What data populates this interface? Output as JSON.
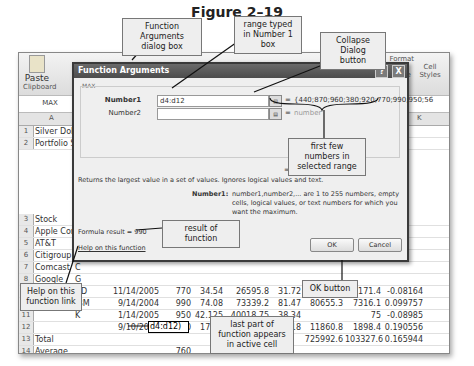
{
  "figure_title": "Figure 2–19",
  "ribbon": {
    "paste_label": "Paste",
    "clipboard_group": "Clipboard",
    "format_table_label": "Format as Table",
    "cell_styles_label": "Cell Styles"
  },
  "name_box": "MAX",
  "columns": [
    "A",
    "K"
  ],
  "rows": [
    {
      "n": "1",
      "a": "Silver Dollar"
    },
    {
      "n": "2",
      "a": "Portfolio Su"
    },
    {
      "n": "3",
      "a": "Stock",
      "b": "S"
    },
    {
      "n": "4",
      "a": "Apple Cor",
      "b": "A"
    },
    {
      "n": "5",
      "a": "AT&T",
      "b": "T"
    },
    {
      "n": "6",
      "a": "Citigroup",
      "b": "C"
    },
    {
      "n": "7",
      "a": "Comcast",
      "b": "C"
    },
    {
      "n": "8",
      "a": "Google",
      "b": "G"
    },
    {
      "n": "9",
      "a": "Home Dep",
      "b": "HD",
      "c": "11/14/2005",
      "d": "770",
      "e": "34.54",
      "f": "26595.8",
      "g": "31.72",
      "h": "24424.4",
      "i": "-2171.4",
      "j": "-0.08164"
    },
    {
      "n": "10",
      "a": "IBM",
      "b": "IBM",
      "c": "9/14/2004",
      "d": "990",
      "e": "74.08",
      "f": "73339.2",
      "g": "81.47",
      "h": "80655.3",
      "i": "7316.1",
      "j": "0.099757"
    },
    {
      "n": "11",
      "a": "",
      "b": "K",
      "c": "1/14/2005",
      "d": "950",
      "e": "42.125",
      "f": "40018.75",
      "g": "38.34",
      "h": "",
      "i": "75",
      "j": "-0.08985"
    },
    {
      "n": "12",
      "a": "",
      "b": "",
      "c": "9/10/2003",
      "d": "560",
      "e": "17.79",
      "f": "9962.4",
      "g": "21.18",
      "h": "11860.8",
      "i": "1898.4",
      "j": "0.190556"
    },
    {
      "n": "13",
      "a": "Total",
      "f": "622665.1",
      "h": "725992.6",
      "i": "103327.6",
      "j": "0.165944"
    },
    {
      "n": "14",
      "a": "Average",
      "d": "760"
    },
    {
      "n": "15",
      "a": "Highest",
      "d": "d4:d12)"
    },
    {
      "n": "16",
      "a": "Lowest"
    }
  ],
  "dialog": {
    "title": "Function Arguments",
    "help_btn": "?",
    "close_btn": "X",
    "function_name": "MAX",
    "number1_label": "Number1",
    "number1_value": "d4:d12",
    "number1_result": "{440;870;960;380;920;770;990;950;56",
    "number2_label": "Number2",
    "number2_result": "number",
    "equals": "=",
    "overall_result": "= 990",
    "description": "Returns the largest value in a set of values. Ignores logical values and text.",
    "arg_desc_label": "Number1:",
    "arg_desc": "number1,number2,... are 1 to 255 numbers, empty cells, logical values, or text numbers for which you want the maximum.",
    "formula_result": "Formula result =   990",
    "help_link": "Help on this function",
    "ok_label": "OK",
    "cancel_label": "Cancel"
  },
  "callouts": {
    "function_arguments": "Function Arguments dialog box",
    "range_typed": "range typed in Number 1 box",
    "collapse_dialog": "Collapse Dialog button",
    "first_numbers": "first few numbers in selected range",
    "result_of_function": "result of function",
    "help_link": "Help on this function link",
    "ok_button": "OK button",
    "last_part": "last part of function appears in active cell"
  }
}
